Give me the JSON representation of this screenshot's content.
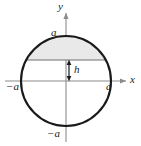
{
  "figure": {
    "kind": "circle-with-shaded-segment",
    "background_color": "#ffffff",
    "curve_color": "#1a1a1a",
    "axis_color": "#8c8c8c",
    "shade_fill": "#e8e8e8",
    "shade_stroke": "#6e6e6e",
    "axes": {
      "x_axis_label": "x",
      "y_axis_label": "y",
      "origin_x": 66,
      "origin_y": 81
    },
    "circle": {
      "center_x": 66,
      "center_y": 81,
      "radius": 45,
      "radius_label": "a"
    },
    "chord": {
      "y_pixel": 60,
      "left_x": 27,
      "right_x": 105
    },
    "labels": {
      "y_axis": "y",
      "x_axis": "x",
      "a_top": "a",
      "a_right": "a",
      "neg_a_left": "−a",
      "neg_a_bottom": "−a",
      "height": "h"
    },
    "dimension_arrow": {
      "name": "h-dimension-arrow",
      "x_pixel": 69,
      "top_y": 60,
      "bottom_y": 81,
      "double_headed": true,
      "label": "h"
    }
  }
}
